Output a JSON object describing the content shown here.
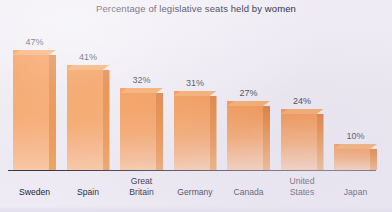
{
  "chart_data": {
    "type": "bar",
    "title": "Percentage of legislative seats held by women",
    "xlabel": "",
    "ylabel": "",
    "ylim": [
      0,
      50
    ],
    "grid": false,
    "legend": "none",
    "orientation": "vertical",
    "style": "3d-bars",
    "categories": [
      "Sweden",
      "Spain",
      "Great\nBritain",
      "Germany",
      "Canada",
      "United\nStates",
      "Japan"
    ],
    "values": [
      47,
      41,
      32,
      31,
      27,
      24,
      10
    ],
    "value_labels": [
      "47%",
      "41%",
      "32%",
      "31%",
      "27%",
      "24%",
      "10%"
    ],
    "colors": {
      "bar_front_top": "#f07f2c",
      "bar_front_bottom": "#f8c8a5",
      "bar_side": "#d9641b",
      "bar_top": "#f39a4e",
      "background": "#ece9f2",
      "text": "#1d1d36",
      "axis": "#3a3a48"
    }
  }
}
